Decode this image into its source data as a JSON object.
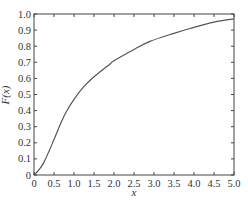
{
  "chart_data": {
    "type": "line",
    "title": "",
    "xlabel": "x",
    "ylabel": "F(x)",
    "xlim": [
      0,
      5.0
    ],
    "ylim": [
      0,
      1.0
    ],
    "grid": false,
    "legend": null,
    "x_ticks": [
      "0",
      "0.5",
      "1.0",
      "1.5",
      "2.0",
      "2.5",
      "3.0",
      "3.5",
      "4.0",
      "4.5",
      "5.0"
    ],
    "y_ticks": [
      "0",
      "0.1",
      "0.2",
      "0.3",
      "0.4",
      "0.5",
      "0.6",
      "0.7",
      "0.8",
      "0.9",
      "1.0"
    ],
    "series": [
      {
        "name": "F(x)",
        "color": "#555555",
        "x": [
          0,
          0.1,
          0.25,
          0.5,
          0.65,
          0.8,
          1.0,
          1.25,
          1.5,
          1.9,
          2.0,
          2.5,
          2.9,
          3.5,
          3.9,
          4.5,
          5.0
        ],
        "y": [
          0,
          0.025,
          0.08,
          0.22,
          0.31,
          0.39,
          0.47,
          0.55,
          0.61,
          0.69,
          0.71,
          0.78,
          0.83,
          0.88,
          0.91,
          0.95,
          0.97
        ]
      }
    ]
  }
}
